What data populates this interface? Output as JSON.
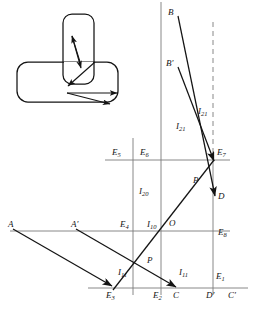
{
  "figure": {
    "type": "engineering-kinematics-diagram",
    "stroke_color": "#141414",
    "thin_line_color": "#7a7a7a",
    "background": "#ffffff"
  },
  "inset": {
    "name": "mechanism-sketch",
    "parts": [
      {
        "name": "vertical-link",
        "shape": "rounded-rect"
      },
      {
        "name": "horizontal-base",
        "shape": "rounded-rect"
      }
    ],
    "arrow_count": 5
  },
  "labels": {
    "B": {
      "text": "B",
      "sub": ""
    },
    "Bp": {
      "text": "B",
      "sub": "",
      "prime": "′"
    },
    "A": {
      "text": "A",
      "sub": ""
    },
    "Ap": {
      "text": "A",
      "sub": "",
      "prime": "′"
    },
    "O": {
      "text": "O",
      "sub": ""
    },
    "D": {
      "text": "D",
      "sub": ""
    },
    "Dp": {
      "text": "D",
      "sub": "",
      "prime": "′"
    },
    "C": {
      "text": "C",
      "sub": ""
    },
    "Cp": {
      "text": "C",
      "sub": "",
      "prime": "′"
    },
    "E1": {
      "text": "E",
      "sub": "1"
    },
    "E2": {
      "text": "E",
      "sub": "2"
    },
    "E3": {
      "text": "E",
      "sub": "3"
    },
    "E4": {
      "text": "E",
      "sub": "4"
    },
    "E5": {
      "text": "E",
      "sub": "5"
    },
    "E6": {
      "text": "E",
      "sub": "6"
    },
    "E7": {
      "text": "E",
      "sub": "7"
    },
    "E8": {
      "text": "E",
      "sub": "8"
    },
    "I10": {
      "text": "I",
      "sub": "10"
    },
    "I11a": {
      "text": "I",
      "sub": "11"
    },
    "I11b": {
      "text": "I",
      "sub": "11"
    },
    "I20": {
      "text": "I",
      "sub": "20"
    },
    "I21a": {
      "text": "I",
      "sub": "21"
    },
    "I21b": {
      "text": "I",
      "sub": "21"
    },
    "P1": {
      "text": "P",
      "sub": ""
    },
    "P2": {
      "text": "P",
      "sub": ""
    }
  },
  "geometry": {
    "points": {
      "B": [
        178,
        16
      ],
      "Bp": [
        178,
        67
      ],
      "A": [
        13,
        229
      ],
      "Ap": [
        76,
        229
      ],
      "O": [
        176,
        231
      ],
      "D": [
        213,
        193
      ],
      "Dp": [
        213,
        288
      ],
      "C": [
        176,
        288
      ],
      "Cp": [
        233,
        288
      ],
      "E2": [
        161,
        288
      ],
      "E3": [
        113,
        288
      ],
      "E7": [
        213,
        160
      ]
    },
    "vertical_lines": [
      {
        "name": "axis-left",
        "x": 133,
        "y1": 138,
        "y2": 295,
        "style": "thin"
      },
      {
        "name": "axis-mid",
        "x": 161,
        "y1": 2,
        "y2": 295,
        "style": "thin"
      },
      {
        "name": "axis-right-dashed",
        "x": 213,
        "y1": 22,
        "y2": 160,
        "style": "dashed"
      },
      {
        "name": "axis-right-solid",
        "x": 213,
        "y1": 160,
        "y2": 295,
        "style": "thin"
      }
    ],
    "horizontal_lines": [
      {
        "name": "line-E5-E6-E7",
        "y": 160,
        "x1": 105,
        "x2": 230,
        "style": "thin"
      },
      {
        "name": "line-E4-O-E8",
        "y": 231,
        "x1": 10,
        "x2": 230,
        "style": "thin"
      },
      {
        "name": "base-axis",
        "y": 288,
        "x1": 88,
        "x2": 248,
        "style": "thin"
      }
    ],
    "rays": [
      {
        "name": "ray-B-D",
        "from": [
          178,
          16
        ],
        "to": [
          216,
          198
        ],
        "arrow": true
      },
      {
        "name": "ray-Bp-E7",
        "from": [
          178,
          67
        ],
        "to": [
          215,
          163
        ],
        "arrow": true
      },
      {
        "name": "ray-A-E3",
        "from": [
          13,
          229
        ],
        "to": [
          113,
          288
        ],
        "arrow": true
      },
      {
        "name": "ray-Ap-C",
        "from": [
          76,
          229
        ],
        "to": [
          178,
          290
        ],
        "arrow": true
      },
      {
        "name": "ray-E3-E7",
        "from": [
          113,
          290
        ],
        "to": [
          215,
          160
        ],
        "arrow": false
      }
    ]
  }
}
